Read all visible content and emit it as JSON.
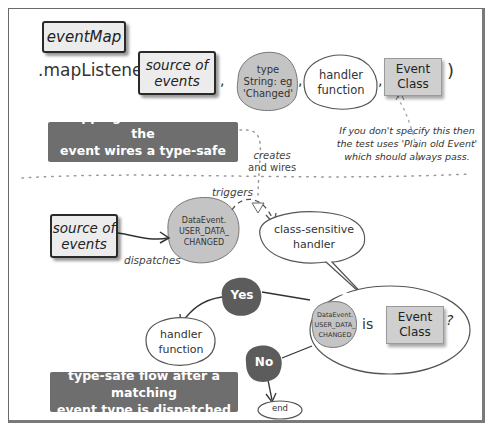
{
  "diagram": {
    "top": {
      "object_label": "eventMap",
      "method_call": ".mapListener(",
      "args": [
        {
          "label": "source of\nevents",
          "line1": "source of",
          "line2": "events",
          "style": "box"
        },
        {
          "line1": "type",
          "line2": "String: eg",
          "line3": "'Changed'",
          "style": "grey-blob"
        },
        {
          "line1": "handler",
          "line2": "function",
          "style": "outline-blob"
        },
        {
          "line1": "Event",
          "line2": "Class",
          "style": "grey-box"
        }
      ],
      "separators": [
        ",",
        ",",
        ","
      ],
      "closing_paren": ")",
      "note": {
        "line1": "If you don't specify this then",
        "line2": "the test uses 'Plain old Event'",
        "line3": "which should always pass."
      },
      "banner": {
        "line1": "mapping the listener to the",
        "line2": "event wires a type-safe handler"
      },
      "creates_label": {
        "line1": "creates",
        "line2": "and wires"
      }
    },
    "bottom": {
      "source_box": {
        "line1": "source of",
        "line2": "events"
      },
      "dispatches_label": "dispatches",
      "event_blob": {
        "line1": "DataEvent.",
        "line2": "USER_DATA_",
        "line3": "CHANGED"
      },
      "triggers_label": "triggers",
      "handler_bubble": {
        "line1": "class-sensitive",
        "line2": "handler"
      },
      "question": {
        "event_blob": {
          "line1": "DataEvent.",
          "line2": "USER_DATA_",
          "line3": "CHANGED"
        },
        "is_label": "is",
        "class_box": {
          "line1": "Event",
          "line2": "Class"
        },
        "question_mark": "?"
      },
      "yes_label": "Yes",
      "no_label": "No",
      "handler_function": {
        "line1": "handler",
        "line2": "function"
      },
      "end_label": "end",
      "banner": {
        "line1": "type-safe flow after a matching",
        "line2": "event type is dispatched"
      }
    },
    "colors": {
      "banner_bg": "#6e6e6e",
      "grey_blob": "#c4c4c4",
      "dark_circle": "#5c5c5c",
      "box_fill": "#ececec",
      "grey_box": "#cfcfcf"
    }
  }
}
